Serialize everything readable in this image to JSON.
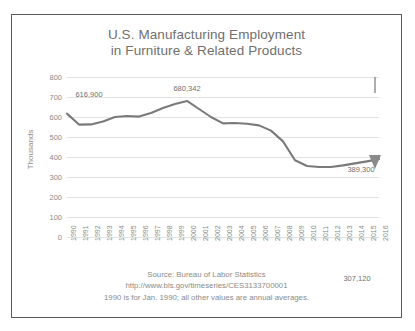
{
  "chart_data": {
    "type": "line",
    "title": "U.S. Manufacturing Employment",
    "subtitle": "in Furniture & Related Products",
    "xlabel": "",
    "ylabel": "Thousands",
    "ylim": [
      0,
      800
    ],
    "ytick_labels": [
      "800",
      "700",
      "600",
      "500",
      "400",
      "300",
      "200",
      "100",
      "0"
    ],
    "yticks": [
      800,
      700,
      600,
      500,
      400,
      300,
      200,
      100,
      0
    ],
    "grid": true,
    "legend": "none",
    "line_color": "#7a7a7a",
    "categories": [
      "1990",
      "1991",
      "1992",
      "1993",
      "1994",
      "1995",
      "1996",
      "1997",
      "1998",
      "1999",
      "2000",
      "2001",
      "2002",
      "2003",
      "2004",
      "2005",
      "2006",
      "2007",
      "2008",
      "2009",
      "2010",
      "2011",
      "2012",
      "2013",
      "2014",
      "2015",
      "2016"
    ],
    "values": [
      616.9,
      562.0,
      563.0,
      578.0,
      600.0,
      605.0,
      602.0,
      620.0,
      645.0,
      665.0,
      680.3,
      640.0,
      600.0,
      568.0,
      570.0,
      566.0,
      558.0,
      532.0,
      478.0,
      384.0,
      355.0,
      350.0,
      350.0,
      358.0,
      368.0,
      378.0,
      389.3
    ],
    "annotations": [
      {
        "name": "start-value-label",
        "text": "616,900",
        "year": "1990",
        "value": 616.9
      },
      {
        "name": "peak-value-label",
        "text": "680,342",
        "year": "2000",
        "value": 680.342
      },
      {
        "name": "decline-value-label",
        "text": "307,120",
        "value": 307.12
      },
      {
        "name": "end-value-label",
        "text": "389,300",
        "year": "2016",
        "value": 389.3
      }
    ]
  },
  "footer": {
    "line1": "Source: Bureau of Labor Statistics",
    "line2": "http://www.bls.gov/timeseries/CES3133700001",
    "line3": "1990 is for Jan. 1990; all other values are annual averages."
  }
}
